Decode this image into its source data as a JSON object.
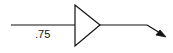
{
  "diagram": {
    "type": "signal-flow",
    "gain_block": {
      "label": ".75",
      "shape": "triangle-amplifier"
    },
    "colors": {
      "stroke": "#111111",
      "background": "#ffffff"
    }
  }
}
